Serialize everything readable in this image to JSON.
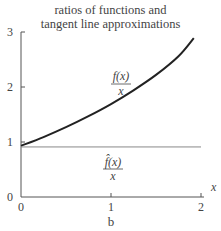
{
  "chart_data": {
    "type": "line",
    "title": "ratios of functions and tangent line approximations",
    "title_lines": [
      "ratios of functions and",
      "tangent line approximations"
    ],
    "xlabel": "x",
    "ylabel": "",
    "caption": "b",
    "xlim": [
      0,
      2
    ],
    "ylim": [
      0,
      3
    ],
    "x_ticks": [
      0,
      1,
      2
    ],
    "x_tick_labels": [
      "0",
      "1",
      "2"
    ],
    "y_ticks": [
      0,
      1,
      2,
      3
    ],
    "y_tick_labels": [
      "0",
      "1",
      "2",
      "3"
    ],
    "grid": false,
    "legend": "none (inline labels)",
    "series": [
      {
        "name": "f(x)/x",
        "label_numerator": "f(x)",
        "label_denominator": "x",
        "color": "#222222",
        "x": [
          0,
          0.25,
          0.5,
          0.75,
          1.0,
          1.25,
          1.5,
          1.75,
          1.92
        ],
        "y": [
          0.93,
          1.09,
          1.27,
          1.47,
          1.69,
          1.94,
          2.22,
          2.56,
          2.89
        ]
      },
      {
        "name": "f̂(x)/x",
        "label_numerator": "f̂(x)",
        "label_denominator": "x",
        "color": "#888888",
        "x": [
          0,
          2
        ],
        "y": [
          0.91,
          0.91
        ]
      }
    ]
  }
}
